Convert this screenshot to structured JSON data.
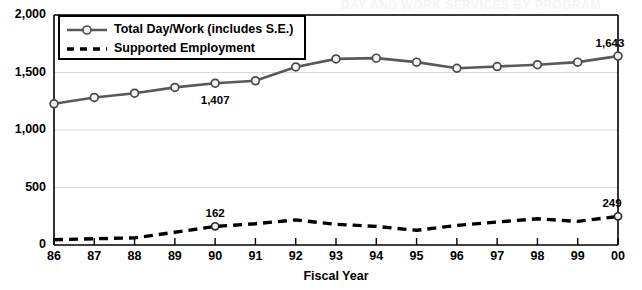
{
  "ghost_title": "DAY AND WORK SERVICES BY PROGRAM",
  "axes": {
    "x_title": "Fiscal Year",
    "y_ticks": [
      "0",
      "500",
      "1,000",
      "1,500",
      "2,000"
    ],
    "x_ticks": [
      "86",
      "87",
      "88",
      "89",
      "90",
      "91",
      "92",
      "93",
      "94",
      "95",
      "96",
      "97",
      "98",
      "99",
      "00"
    ]
  },
  "legend": {
    "items": [
      {
        "label": "Total Day/Work (includes S.E.)",
        "style": "solid-marker",
        "color": "#595959"
      },
      {
        "label": "Supported Employment",
        "style": "dashed",
        "color": "#000000"
      }
    ]
  },
  "annotations": [
    {
      "text": "1,407",
      "series": "Total Day/Work (includes S.E.)",
      "x": "90",
      "value": 1407
    },
    {
      "text": "1,643",
      "series": "Total Day/Work (includes S.E.)",
      "x": "00",
      "value": 1643
    },
    {
      "text": "162",
      "series": "Supported Employment",
      "x": "90",
      "value": 162
    },
    {
      "text": "249",
      "series": "Supported Employment",
      "x": "00",
      "value": 249
    }
  ],
  "chart_data": {
    "type": "line",
    "title": "",
    "xlabel": "Fiscal Year",
    "ylabel": "",
    "ylim": [
      0,
      2000
    ],
    "yticks": [
      0,
      500,
      1000,
      1500,
      2000
    ],
    "grid": true,
    "legend_position": "top-left",
    "categories": [
      "86",
      "87",
      "88",
      "89",
      "90",
      "91",
      "92",
      "93",
      "94",
      "95",
      "96",
      "97",
      "98",
      "99",
      "00"
    ],
    "series": [
      {
        "name": "Total Day/Work (includes S.E.)",
        "style": "solid",
        "marker": "circle",
        "color": "#595959",
        "values": [
          1228,
          1283,
          1320,
          1370,
          1407,
          1428,
          1548,
          1618,
          1625,
          1590,
          1537,
          1552,
          1568,
          1590,
          1643
        ]
      },
      {
        "name": "Supported Employment",
        "style": "dashed",
        "marker": "none",
        "color": "#000000",
        "values": [
          45,
          55,
          62,
          110,
          162,
          185,
          218,
          180,
          162,
          128,
          170,
          200,
          228,
          205,
          249
        ]
      }
    ]
  }
}
